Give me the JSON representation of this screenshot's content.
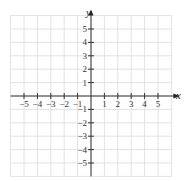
{
  "chart_data": {
    "type": "scatter",
    "title": "",
    "xlabel": "x",
    "ylabel": "y",
    "xlim": [
      -6,
      6
    ],
    "ylim": [
      -6,
      6
    ],
    "grid": true,
    "x_ticks": [
      "−5",
      "−4",
      "−3",
      "−2",
      "−1",
      "1",
      "2",
      "3",
      "4",
      "5"
    ],
    "y_ticks": [
      "5",
      "4",
      "3",
      "2",
      "1",
      "−1",
      "−2",
      "−3",
      "−4",
      "−5"
    ],
    "series": []
  },
  "labels": {
    "x_axis": "x",
    "y_axis": "y"
  },
  "colors": {
    "grid": "#e2e2e2",
    "axis": "#333333"
  }
}
